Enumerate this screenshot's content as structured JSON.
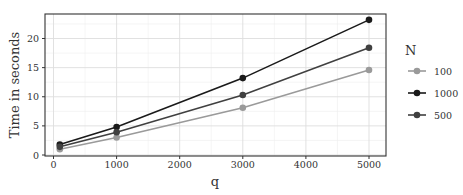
{
  "chart_data": {
    "type": "line",
    "title": "",
    "xlabel": "q",
    "ylabel": "Time in seconds",
    "x": [
      100,
      1000,
      3000,
      5000
    ],
    "xlim": [
      -200,
      5250
    ],
    "ylim": [
      0,
      24
    ],
    "xticks": [
      0,
      1000,
      2000,
      3000,
      4000,
      5000
    ],
    "yticks": [
      0,
      5,
      10,
      15,
      20
    ],
    "grid": true,
    "legend": {
      "title": "N",
      "position": "right"
    },
    "series": [
      {
        "name": "100",
        "color": "#9a9a9a",
        "values": [
          1.0,
          3.0,
          8.1,
          14.6
        ]
      },
      {
        "name": "1000",
        "color": "#1a1a1a",
        "values": [
          1.8,
          4.8,
          13.2,
          23.2
        ]
      },
      {
        "name": "500",
        "color": "#404040",
        "values": [
          1.4,
          3.9,
          10.3,
          18.4
        ]
      }
    ]
  }
}
